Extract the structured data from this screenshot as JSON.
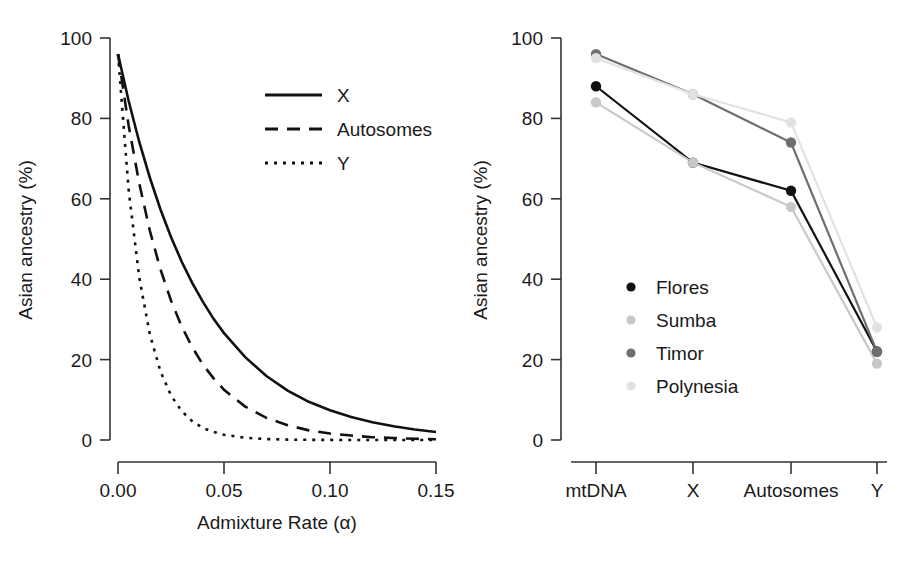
{
  "figure": {
    "panels": [
      "left",
      "right"
    ],
    "shared_ylabel": "Asian ancestry (%)"
  },
  "left_panel": {
    "ylabel": "Asian ancestry (%)",
    "xlabel": "Admixture Rate (α)",
    "y_ticks": [
      "0",
      "20",
      "40",
      "60",
      "80",
      "100"
    ],
    "x_ticks": [
      "0.00",
      "0.05",
      "0.10",
      "0.15"
    ],
    "legend": [
      {
        "label": "X",
        "dash": "solid"
      },
      {
        "label": "Autosomes",
        "dash": "dashed"
      },
      {
        "label": "Y",
        "dash": "dotted"
      }
    ]
  },
  "right_panel": {
    "ylabel": "Asian ancestry (%)",
    "y_ticks": [
      "0",
      "20",
      "40",
      "60",
      "80",
      "100"
    ],
    "x_ticks": [
      "mtDNA",
      "X",
      "Autosomes",
      "Y"
    ],
    "legend": [
      {
        "label": "Flores",
        "color": "#111111"
      },
      {
        "label": "Sumba",
        "color": "#c8c8c8"
      },
      {
        "label": "Timor",
        "color": "#6e6e6e"
      },
      {
        "label": "Polynesia",
        "color": "#e2e2e2"
      }
    ]
  },
  "chart_data": [
    {
      "type": "line",
      "panel": "left",
      "title": "",
      "xlabel": "Admixture Rate (α)",
      "ylabel": "Asian ancestry (%)",
      "xlim": [
        0,
        0.15
      ],
      "ylim": [
        0,
        100
      ],
      "xticks": [
        0,
        0.05,
        0.1,
        0.15
      ],
      "yticks": [
        0,
        20,
        40,
        60,
        80,
        100
      ],
      "grid": false,
      "legend_position": "upper-right",
      "x": [
        0,
        0.005,
        0.01,
        0.015,
        0.02,
        0.025,
        0.03,
        0.035,
        0.04,
        0.045,
        0.05,
        0.06,
        0.07,
        0.08,
        0.09,
        0.1,
        0.11,
        0.12,
        0.13,
        0.14,
        0.15
      ],
      "series": [
        {
          "name": "X",
          "dash": "solid",
          "color": "#111111",
          "values": [
            96,
            84.4,
            74.2,
            65.3,
            57.4,
            50.5,
            44.4,
            39.1,
            34.4,
            30.2,
            26.6,
            20.6,
            15.9,
            12.3,
            9.5,
            7.4,
            5.7,
            4.4,
            3.4,
            2.6,
            2.0
          ]
        },
        {
          "name": "Autosomes",
          "dash": "dashed",
          "color": "#111111",
          "values": [
            96,
            78.3,
            63.9,
            52.1,
            42.5,
            34.7,
            28.3,
            23.1,
            18.8,
            15.4,
            12.5,
            8.3,
            5.5,
            3.7,
            2.4,
            1.6,
            1.1,
            0.7,
            0.5,
            0.3,
            0.2
          ]
        },
        {
          "name": "Y",
          "dash": "dotted",
          "color": "#111111",
          "values": [
            96,
            62.3,
            40.5,
            26.3,
            17.1,
            11.1,
            7.2,
            4.7,
            3.0,
            2.0,
            1.3,
            0.55,
            0.23,
            0.1,
            0.04,
            0.02,
            0.01,
            0.0,
            0.0,
            0.0,
            0.0
          ]
        }
      ]
    },
    {
      "type": "line",
      "panel": "right",
      "title": "",
      "xlabel": "",
      "ylabel": "Asian ancestry (%)",
      "ylim": [
        0,
        100
      ],
      "yticks": [
        0,
        20,
        40,
        60,
        80,
        100
      ],
      "grid": false,
      "legend_position": "center-left",
      "categories": [
        "mtDNA",
        "X",
        "Autosomes",
        "Y"
      ],
      "series": [
        {
          "name": "Flores",
          "color": "#111111",
          "values": [
            88,
            69,
            62,
            22
          ]
        },
        {
          "name": "Sumba",
          "color": "#c8c8c8",
          "values": [
            84,
            69,
            58,
            19
          ]
        },
        {
          "name": "Timor",
          "color": "#6e6e6e",
          "values": [
            96,
            86,
            74,
            22
          ]
        },
        {
          "name": "Polynesia",
          "color": "#e2e2e2",
          "values": [
            95,
            86,
            79,
            28
          ]
        }
      ]
    }
  ]
}
